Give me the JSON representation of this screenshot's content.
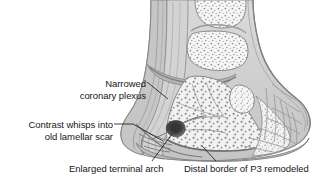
{
  "figure": {
    "kind": "anatomical-illustration",
    "style": "grayscale line-and-tone medical drawing",
    "palette": {
      "background": "#ffffff",
      "tissue_light": "#d9d9d9",
      "tissue_mid": "#bdbdbd",
      "tissue_dark": "#9a9a9a",
      "outline": "#7d7d7d",
      "bone_fill": "#f4f4f4",
      "stipple": "#8c8c8c",
      "lesion_dark": "#3a3a3a",
      "text": "#171717",
      "leader_line": "#2b2b2b"
    }
  },
  "labels": [
    {
      "id": "narrowed-coronary-plexus",
      "line1": "Narrowed",
      "line2": "coronary plexus",
      "align": "right"
    },
    {
      "id": "contrast-whisps",
      "line1": "Contrast whisps into",
      "line2": "old lamellar scar",
      "align": "right"
    },
    {
      "id": "enlarged-terminal-arch",
      "line1": "Enlarged terminal arch",
      "line2": "",
      "align": "center"
    },
    {
      "id": "distal-border-p3",
      "line1": "Distal border of P3 remodeled",
      "line2": "",
      "align": "center"
    }
  ],
  "anatomy_regions": [
    {
      "name": "middle-phalanx-P2",
      "note": "upper trabecular bone block"
    },
    {
      "name": "proximal-phalanx-P1",
      "note": "topmost bone, partially shown"
    },
    {
      "name": "distal-phalanx-P3",
      "note": "coffin bone, lower wedge"
    },
    {
      "name": "navicular-bone",
      "note": "small oval bone, palmar"
    },
    {
      "name": "coronary-plexus",
      "note": "narrowed vascular bed at coronary band"
    },
    {
      "name": "hoof-wall-vasculature",
      "note": "branching vessel network, dorsal wall"
    },
    {
      "name": "terminal-arch",
      "note": "dark enlarged vascular blob within P3"
    },
    {
      "name": "lamellar-scar",
      "note": "contrast whisps, dorsal lamellae"
    },
    {
      "name": "digital-cushion",
      "note": "heel bulb soft tissue"
    },
    {
      "name": "sole-and-white-line",
      "note": "ground surface border"
    }
  ]
}
